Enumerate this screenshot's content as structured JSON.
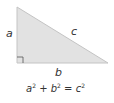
{
  "diagram": {
    "type": "right-triangle",
    "fill_color": "#e2e2e2",
    "stroke_color": "#bdbdbd",
    "labels": {
      "a": "a",
      "b": "b",
      "c": "c"
    },
    "right_angle_marker": true,
    "formula": {
      "a": "a",
      "a_exp": "2",
      "plus": " + ",
      "b": "b",
      "b_exp": "2",
      "eq": " = ",
      "c": "c",
      "c_exp": "2"
    }
  }
}
